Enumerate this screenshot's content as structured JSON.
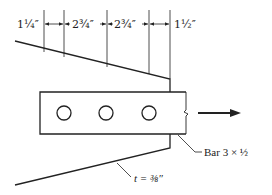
{
  "diagram": {
    "type": "engineering-drawing",
    "dimensions": [
      {
        "id": "d1",
        "label": "1¼″"
      },
      {
        "id": "d2",
        "label": "2¾″"
      },
      {
        "id": "d3",
        "label": "2¾″"
      },
      {
        "id": "d4",
        "label": "1½″"
      }
    ],
    "labels": {
      "bar": "Bar 3 × ½",
      "thickness": "t = ⅜″"
    },
    "holes": 3,
    "load_direction": "arrow-right",
    "colors": {
      "line": "#222222",
      "background": "#ffffff"
    }
  }
}
